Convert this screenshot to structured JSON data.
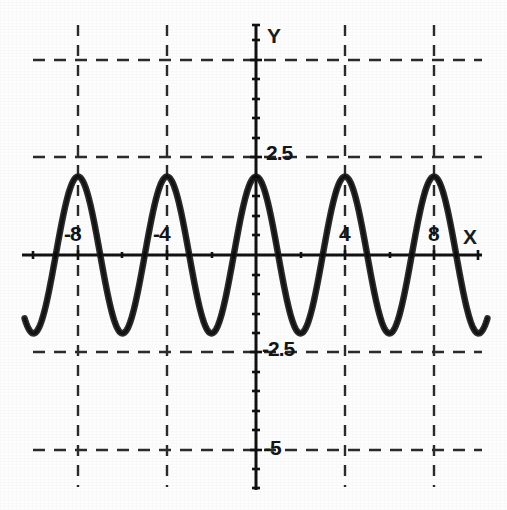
{
  "chart_data": {
    "type": "line",
    "title": "",
    "subtitle": "",
    "xlabel": "X",
    "ylabel": "Y",
    "xlim": [
      -10.2,
      10.2
    ],
    "ylim": [
      -6.0,
      5.9
    ],
    "grid": true,
    "legend": null,
    "legend_position": "none",
    "function": "y = 2*cos(pi*x/2)",
    "amplitude": 2,
    "period": 4,
    "x_tick_labels": [
      "-8",
      "-4",
      "4",
      "8"
    ],
    "x_tick_values": [
      -8,
      -4,
      4,
      8
    ],
    "x_minor_tick_step": 1,
    "y_tick_labels": [
      "2.5",
      "-2.5",
      "-5"
    ],
    "y_tick_values": [
      2.5,
      -2.5,
      -5
    ],
    "y_minor_tick_step": 0.5,
    "x_gridlines": [
      -8,
      -4,
      0,
      4,
      8
    ],
    "y_gridlines": [
      5,
      2.5,
      -2.5,
      -5
    ],
    "series": [
      {
        "name": "curve",
        "color": "#1a1a1a",
        "x": [
          -10,
          -9.5,
          -9,
          -8.5,
          -8,
          -7.5,
          -7,
          -6.5,
          -6,
          -5.5,
          -5,
          -4.5,
          -4,
          -3.5,
          -3,
          -2.5,
          -2,
          -1.5,
          -1,
          -0.5,
          0,
          0.5,
          1,
          1.5,
          2,
          2.5,
          3,
          3.5,
          4,
          4.5,
          5,
          5.5,
          6,
          6.5,
          7,
          7.5,
          8,
          8.5,
          9,
          9.5,
          10
        ],
        "y": [
          -2,
          -1.41,
          0,
          1.41,
          2,
          1.41,
          0,
          -1.41,
          -2,
          -1.41,
          0,
          1.41,
          2,
          1.41,
          0,
          -1.41,
          -2,
          -1.41,
          0,
          1.41,
          2,
          1.41,
          0,
          -1.41,
          -2,
          -1.41,
          0,
          1.41,
          2,
          1.41,
          0,
          -1.41,
          -2,
          -1.41,
          0,
          1.41,
          2,
          1.41,
          0,
          -1.41,
          -2
        ]
      }
    ]
  },
  "axes": {
    "x_axis_label": "X",
    "y_axis_label": "Y"
  },
  "ticks": {
    "x": [
      {
        "label": "-8",
        "value": -8
      },
      {
        "label": "-4",
        "value": -4
      },
      {
        "label": "4",
        "value": 4
      },
      {
        "label": "8",
        "value": 8
      }
    ],
    "y": [
      {
        "label": "2.5",
        "value": 2.5
      },
      {
        "label": "-2.5",
        "value": -2.5
      },
      {
        "label": "-5",
        "value": -5
      }
    ]
  },
  "style": {
    "curve_color": "#1a1a1a",
    "axis_color": "#111111",
    "grid_color": "#2b2b2b",
    "background": "#fdfdfd",
    "text_color": "#151515"
  }
}
